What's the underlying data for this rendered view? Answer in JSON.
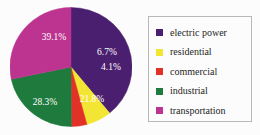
{
  "chart_data": {
    "type": "pie",
    "title": "",
    "subtitle": "",
    "xlabel": "",
    "ylabel": "",
    "grid": false,
    "legend_position": "right",
    "categories": [
      "electric power",
      "residential",
      "commercial",
      "industrial",
      "transportation"
    ],
    "values": [
      39.1,
      6.7,
      4.1,
      21.8,
      28.3
    ],
    "data_labels": [
      "39.1%",
      "6.7%",
      "4.1%",
      "21.8%",
      "28.3%"
    ],
    "colors": [
      "#4b1f6f",
      "#f2e534",
      "#e23127",
      "#1f7a3d",
      "#bd3390"
    ],
    "start_angle_deg": 0,
    "direction": "clockwise",
    "slices": [
      {
        "name": "electric power",
        "value": 39.1,
        "label": "39.1%",
        "color": "#4b1f6f",
        "label_x": 44,
        "label_y": 33
      },
      {
        "name": "residential",
        "value": 6.7,
        "label": "6.7%",
        "color": "#f2e534",
        "label_x": 97,
        "label_y": 48
      },
      {
        "name": "commercial",
        "value": 4.1,
        "label": "4.1%",
        "color": "#e23127",
        "label_x": 101,
        "label_y": 63
      },
      {
        "name": "industrial",
        "value": 21.8,
        "label": "21.8%",
        "color": "#1f7a3d",
        "label_x": 82,
        "label_y": 95
      },
      {
        "name": "transportation",
        "value": 28.3,
        "label": "28.3%",
        "color": "#bd3390",
        "label_x": 35,
        "label_y": 98
      }
    ]
  },
  "legend": {
    "items": [
      {
        "label": "electric power",
        "color": "#4b1f6f"
      },
      {
        "label": "residential",
        "color": "#f2e534"
      },
      {
        "label": "commercial",
        "color": "#e23127"
      },
      {
        "label": "industrial",
        "color": "#1f7a3d"
      },
      {
        "label": "transportation",
        "color": "#bd3390"
      }
    ]
  }
}
